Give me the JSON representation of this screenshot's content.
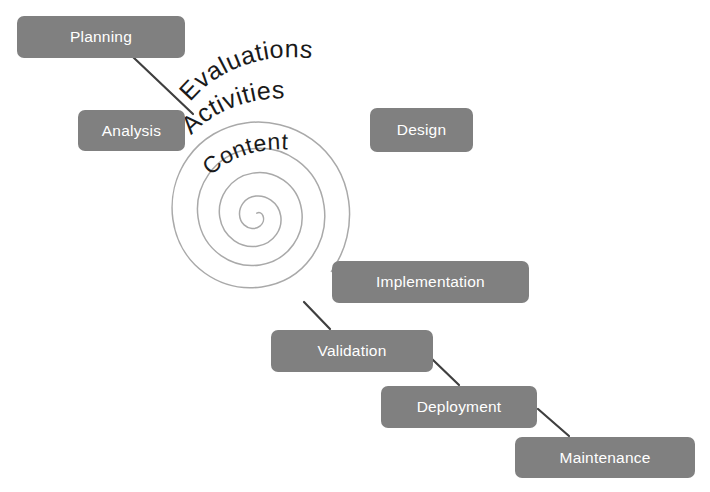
{
  "diagram": {
    "background_color": "#ffffff",
    "box_fill_color": "#808080",
    "box_text_color": "#ffffff",
    "spiral_stroke_color": "#a9a9a9",
    "connector_color": "#3f3f3f",
    "arc_text_color": "#1a1a1a"
  },
  "spiral_labels": [
    {
      "id": "evaluations",
      "text": "Evaluations",
      "ring": "outer"
    },
    {
      "id": "activities",
      "text": "Activities",
      "ring": "middle"
    },
    {
      "id": "content",
      "text": "Content",
      "ring": "inner"
    }
  ],
  "nodes": [
    {
      "id": "planning",
      "label": "Planning",
      "x": 17,
      "y": 16,
      "w": 168,
      "h": 42
    },
    {
      "id": "analysis",
      "label": "Analysis",
      "x": 78,
      "y": 110,
      "w": 107,
      "h": 41
    },
    {
      "id": "design",
      "label": "Design",
      "x": 370,
      "y": 108,
      "w": 103,
      "h": 44
    },
    {
      "id": "implementation",
      "label": "Implementation",
      "x": 332,
      "y": 261,
      "w": 197,
      "h": 42
    },
    {
      "id": "validation",
      "label": "Validation",
      "x": 271,
      "y": 330,
      "w": 162,
      "h": 42
    },
    {
      "id": "deployment",
      "label": "Deployment",
      "x": 381,
      "y": 386,
      "w": 156,
      "h": 42
    },
    {
      "id": "maintenance",
      "label": "Maintenance",
      "x": 515,
      "y": 437,
      "w": 180,
      "h": 41
    }
  ],
  "connectors": [
    {
      "id": "planning-to-analysis",
      "from": "planning",
      "to": "analysis"
    },
    {
      "id": "implementation-to-validation",
      "from": "implementation",
      "to": "validation"
    },
    {
      "id": "validation-to-deployment",
      "from": "validation",
      "to": "deployment"
    },
    {
      "id": "deployment-to-maintenance",
      "from": "deployment",
      "to": "maintenance"
    }
  ]
}
